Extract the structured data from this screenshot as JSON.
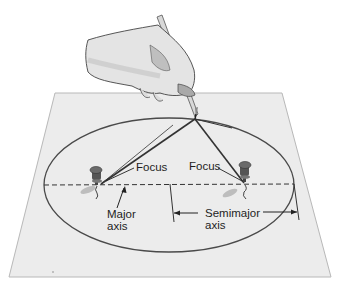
{
  "diagram": {
    "labels": {
      "focus_left": "Focus",
      "focus_right": "Focus",
      "major_axis_line1": "Major",
      "major_axis_line2": "axis",
      "semimajor_axis_line1": "Semimajor",
      "semimajor_axis_line2": "axis"
    },
    "elements": {
      "paper": "sheet-of-paper",
      "ellipse": "ellipse-curve",
      "major_axis": "dashed-major-axis-line",
      "pins": [
        "left-pushpin-at-focus",
        "right-pushpin-at-focus"
      ],
      "string": "string-loop-from-pencil-to-both-foci",
      "hand": "hand-holding-pencil"
    },
    "colors": {
      "paper": "#ececec",
      "paper_edge": "#b8b8b8",
      "ellipse": "#4a4a4a",
      "string": "#333333",
      "text": "#1e1e1e",
      "skin": "#e2e2e2",
      "pin": "#555555"
    }
  }
}
